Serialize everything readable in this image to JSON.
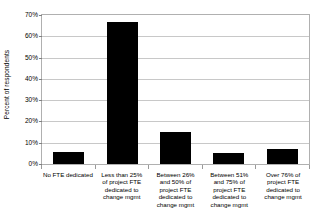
{
  "chart_data": {
    "type": "bar",
    "title": "",
    "xlabel": "",
    "ylabel": "Percent of respondents",
    "categories": [
      "No FTE dedicated",
      "Less than 25% of project FTE dedicated to change mgmt",
      "Between 26% and 50% of project FTE dedicated to change mgmt",
      "Between 51% and 75% of project FTE dedicated to change mgmt",
      "Over 76% of project FTE dedicated to change mgmt"
    ],
    "category_lines": [
      [
        "No FTE dedicated"
      ],
      [
        "Less than 25%",
        "of project FTE",
        "dedicated to",
        "change mgmt"
      ],
      [
        "Between 26%",
        "and 50% of",
        "project FTE",
        "dedicated to",
        "change mgmt"
      ],
      [
        "Between 51%",
        "and 75% of",
        "project FTE",
        "dedicated to",
        "change mgmt"
      ],
      [
        "Over 76% of",
        "project FTE",
        "dedicated to",
        "change mgmt"
      ]
    ],
    "values": [
      5.5,
      66.5,
      15,
      5,
      7
    ],
    "ylim": [
      0,
      70
    ],
    "ytick_values": [
      0,
      10,
      20,
      30,
      40,
      50,
      60,
      70
    ],
    "ytick_labels": [
      "0%",
      "10%",
      "20%",
      "30%",
      "40%",
      "50%",
      "60%",
      "70%"
    ],
    "grid": true,
    "legend": false,
    "bar_color": "#000000",
    "gridline_color": "#c8c8c8",
    "plot_border_color": "#b0b0b0",
    "background_color": "#ffffff"
  }
}
